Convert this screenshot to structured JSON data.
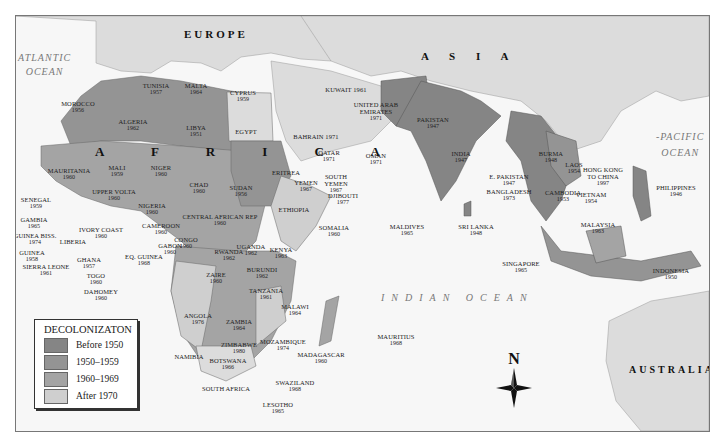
{
  "map": {
    "regions": {
      "europe": "EUROPE",
      "asia": "A S I A",
      "africa": "A F R I C A",
      "australia": "AUSTRALIA"
    },
    "oceans": {
      "atlantic_line1": "ATLANTIC",
      "atlantic_line2": "OCEAN",
      "pacific_line1": "-PACIFIC",
      "pacific_line2": "OCEAN",
      "indian": "INDIAN OCEAN"
    },
    "countries": [
      {
        "name": "TUNISIA",
        "year": "1957"
      },
      {
        "name": "MALTA",
        "year": "1964"
      },
      {
        "name": "CYPRUS",
        "year": "1959"
      },
      {
        "name": "MOROCCO",
        "year": "1956"
      },
      {
        "name": "ALGERIA",
        "year": "1962"
      },
      {
        "name": "LIBYA",
        "year": "1951"
      },
      {
        "name": "EGYPT",
        "year": ""
      },
      {
        "name": "MAURITANIA",
        "year": "1960"
      },
      {
        "name": "MALI",
        "year": "1959"
      },
      {
        "name": "NIGER",
        "year": "1960"
      },
      {
        "name": "CHAD",
        "year": "1960"
      },
      {
        "name": "SUDAN",
        "year": "1956"
      },
      {
        "name": "SENEGAL",
        "year": "1959"
      },
      {
        "name": "GAMBIA",
        "year": "1965"
      },
      {
        "name": "GUINEA BISS.",
        "year": "1974"
      },
      {
        "name": "GUINEA",
        "year": "1958"
      },
      {
        "name": "SIERRA LEONE",
        "year": "1961"
      },
      {
        "name": "LIBERIA",
        "year": ""
      },
      {
        "name": "IVORY COAST",
        "year": "1960"
      },
      {
        "name": "UPPER VOLTA",
        "year": "1960"
      },
      {
        "name": "GHANA",
        "year": "1957"
      },
      {
        "name": "TOGO",
        "year": "1960"
      },
      {
        "name": "DAHOMEY",
        "year": "1960"
      },
      {
        "name": "NIGERIA",
        "year": "1960"
      },
      {
        "name": "CAMEROON",
        "year": "1960"
      },
      {
        "name": "EQ. GUINEA",
        "year": "1968"
      },
      {
        "name": "GABON",
        "year": "1960"
      },
      {
        "name": "CONGO",
        "year": "1960"
      },
      {
        "name": "CENTRAL AFRICAN REP",
        "year": "1960"
      },
      {
        "name": "ERITREA",
        "year": ""
      },
      {
        "name": "ETHIOPIA",
        "year": ""
      },
      {
        "name": "SOMALIA",
        "year": "1960"
      },
      {
        "name": "DJIBOUTI",
        "year": "1977"
      },
      {
        "name": "UGANDA",
        "year": "1962"
      },
      {
        "name": "KENYA",
        "year": "1963"
      },
      {
        "name": "RWANDA",
        "year": "1962"
      },
      {
        "name": "BURUNDI",
        "year": "1962"
      },
      {
        "name": "ZAIRE",
        "year": "1960"
      },
      {
        "name": "TANZANIA",
        "year": "1961"
      },
      {
        "name": "MALAWI",
        "year": "1964"
      },
      {
        "name": "ANGOLA",
        "year": "1976"
      },
      {
        "name": "ZAMBIA",
        "year": "1964"
      },
      {
        "name": "ZIMBABWE",
        "year": "1980"
      },
      {
        "name": "MOZAMBIQUE",
        "year": "1974"
      },
      {
        "name": "MADAGASCAR",
        "year": "1960"
      },
      {
        "name": "NAMIBIA",
        "year": ""
      },
      {
        "name": "BOTSWANA",
        "year": "1966"
      },
      {
        "name": "SWAZILAND",
        "year": "1968"
      },
      {
        "name": "SOUTH AFRICA",
        "year": ""
      },
      {
        "name": "LESOTHO",
        "year": "1965"
      },
      {
        "name": "MAURITIUS",
        "year": "1968"
      },
      {
        "name": "KUWAIT",
        "year": "1961"
      },
      {
        "name": "UNITED ARAB EMIRATES",
        "year": "1971"
      },
      {
        "name": "BAHRAIN",
        "year": "1971"
      },
      {
        "name": "QATAR",
        "year": "1971"
      },
      {
        "name": "OMAN",
        "year": "1971"
      },
      {
        "name": "YEMEN",
        "year": "1967"
      },
      {
        "name": "SOUTH YEMEN",
        "year": "1967"
      },
      {
        "name": "PAKISTAN",
        "year": "1947"
      },
      {
        "name": "INDIA",
        "year": "1947"
      },
      {
        "name": "E. PAKISTAN",
        "year": "1947"
      },
      {
        "name": "BANGLADESH",
        "year": "1973"
      },
      {
        "name": "MALDIVES",
        "year": "1965"
      },
      {
        "name": "SRI LANKA",
        "year": "1948"
      },
      {
        "name": "BURMA",
        "year": "1948"
      },
      {
        "name": "LAOS",
        "year": "1954"
      },
      {
        "name": "CAMBODIA",
        "year": "1953"
      },
      {
        "name": "VIETNAM",
        "year": "1954"
      },
      {
        "name": "HONG KONG TO CHINA",
        "year": "1997"
      },
      {
        "name": "PHILIPPINES",
        "year": "1946"
      },
      {
        "name": "MALAYSIA",
        "year": "1963"
      },
      {
        "name": "SINGAPORE",
        "year": "1965"
      },
      {
        "name": "INDONESIA",
        "year": "1950"
      }
    ]
  },
  "legend": {
    "title": "DECOLONIZATON",
    "items": [
      {
        "label": "Before 1950",
        "color": "#858585"
      },
      {
        "label": "1950–1959",
        "color": "#949494"
      },
      {
        "label": "1960–1969",
        "color": "#a4a4a4"
      },
      {
        "label": "After 1970",
        "color": "#cfcfcf"
      }
    ]
  },
  "compass": {
    "label": "N"
  },
  "colors": {
    "ocean": "#f7f7f7",
    "land_other": "#dcdcdc",
    "before_1950": "#858585",
    "d1950s": "#949494",
    "d1960s": "#a4a4a4",
    "after_1970": "#cfcfcf"
  }
}
